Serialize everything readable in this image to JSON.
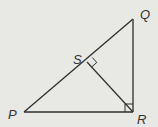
{
  "diagram": {
    "type": "geometry-right-triangle",
    "colors": {
      "background": "#e8e8e5",
      "stroke": "#2e2e2e",
      "label": "#333333"
    },
    "vertices": {
      "P": {
        "label": "P"
      },
      "Q": {
        "label": "Q"
      },
      "R": {
        "label": "R"
      },
      "S": {
        "label": "S"
      }
    },
    "segments": [
      "PQ",
      "QR",
      "PR",
      "SR"
    ],
    "right_angles": [
      "QRP",
      "PSR"
    ]
  }
}
